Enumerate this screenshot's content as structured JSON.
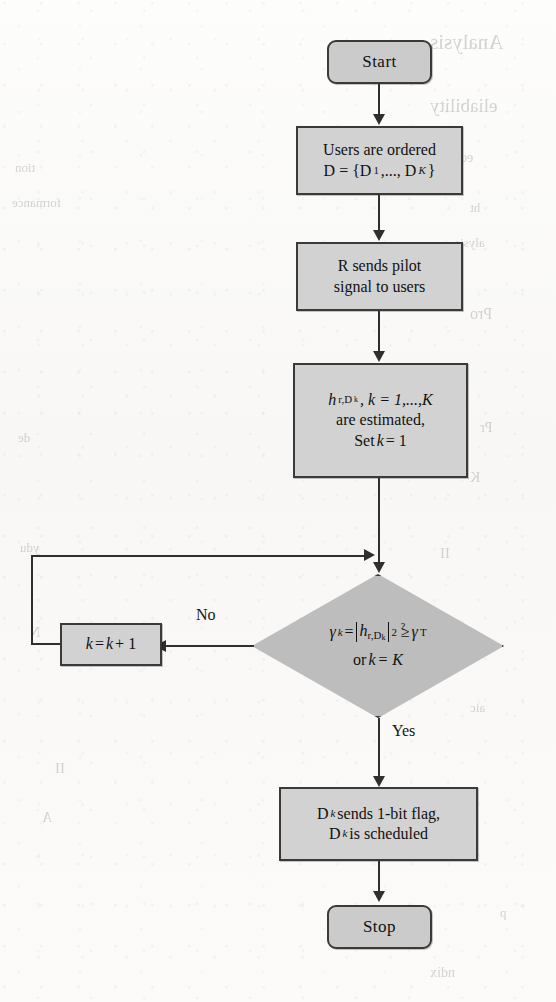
{
  "document": {
    "type": "flowchart",
    "title": "User scheduling flowchart",
    "background_note": "faint mirrored bleed-through text from reverse page"
  },
  "background_bleed": [
    {
      "text": "Analysis",
      "x": 430,
      "y": 30,
      "size": 21
    },
    {
      "text": "eliability",
      "x": 430,
      "y": 95,
      "size": 19
    },
    {
      "text": "ed",
      "x": 460,
      "y": 150,
      "size": 14
    },
    {
      "text": "tion",
      "x": 15,
      "y": 160,
      "size": 13
    },
    {
      "text": "formance",
      "x": 12,
      "y": 195,
      "size": 13
    },
    {
      "text": "ht",
      "x": 470,
      "y": 200,
      "size": 13
    },
    {
      "text": "alysis",
      "x": 455,
      "y": 235,
      "size": 13
    },
    {
      "text": "Pro",
      "x": 470,
      "y": 305,
      "size": 16
    },
    {
      "text": "11",
      "x": 430,
      "y": 360,
      "size": 15
    },
    {
      "text": "Pr",
      "x": 480,
      "y": 420,
      "size": 14
    },
    {
      "text": "de",
      "x": 18,
      "y": 430,
      "size": 13
    },
    {
      "text": "K",
      "x": 470,
      "y": 470,
      "size": 14
    },
    {
      "text": "ydu",
      "x": 20,
      "y": 540,
      "size": 13
    },
    {
      "text": "II",
      "x": 440,
      "y": 545,
      "size": 15
    },
    {
      "text": "N",
      "x": 30,
      "y": 625,
      "size": 14
    },
    {
      "text": "aic",
      "x": 470,
      "y": 700,
      "size": 13
    },
    {
      "text": "II",
      "x": 55,
      "y": 760,
      "size": 15
    },
    {
      "text": "A",
      "x": 42,
      "y": 810,
      "size": 14
    },
    {
      "text": "ndix",
      "x": 430,
      "y": 965,
      "size": 14
    },
    {
      "text": "p",
      "x": 500,
      "y": 905,
      "size": 13
    }
  ],
  "flowchart": {
    "nodes": {
      "start": {
        "label": "Start",
        "shape": "terminator"
      },
      "order_users": {
        "line1": "Users are ordered",
        "line2_prefix": "D = {D",
        "line2_sub1": "1",
        "line2_mid": ",...,  D",
        "line2_sub2": "K",
        "line2_suffix": "}",
        "shape": "process"
      },
      "send_pilot": {
        "line1": "R sends pilot",
        "line2": "signal to users",
        "shape": "process"
      },
      "estimate": {
        "line1_h": "h",
        "line1_h_sub": "r,D",
        "line1_h_subsub": "k",
        "line1_rest": ", k = 1,...,K",
        "line2": "are estimated,",
        "line3_prefix": "Set ",
        "line3_k": "k",
        "line3_rest": " = 1",
        "shape": "process"
      },
      "decision": {
        "gamma": "γ",
        "gamma_sub": "k",
        "eq": "=",
        "h": "h",
        "h_sub": "r,D",
        "h_subsub": "k",
        "power": "2",
        "question": "?",
        "geq": "≥",
        "gamma_t": "γ",
        "gamma_t_sub": "T",
        "line2_prefix": "or  ",
        "line2_k": "k",
        "line2_rest": " = K",
        "shape": "decision"
      },
      "increment": {
        "k1": "k",
        "eq": " = ",
        "k2": "k",
        "plus": " + 1",
        "shape": "process"
      },
      "schedule": {
        "line1_d": "D",
        "line1_sub": "k",
        "line1_rest": " sends 1-bit flag,",
        "line2_d": "D",
        "line2_sub": "k",
        "line2_rest": " is scheduled",
        "shape": "process"
      },
      "stop": {
        "label": "Stop",
        "shape": "terminator"
      }
    },
    "edge_labels": {
      "no": "No",
      "yes": "Yes"
    }
  }
}
